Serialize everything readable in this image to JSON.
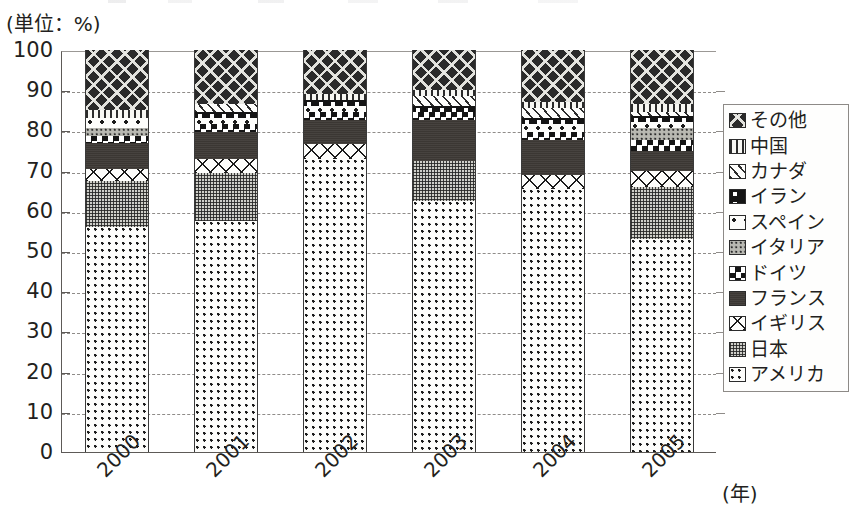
{
  "unit_label": "(単位：%)",
  "axis": {
    "y_ticks": [
      "100",
      "90",
      "80",
      "70",
      "60",
      "50",
      "40",
      "30",
      "20",
      "10",
      "0"
    ],
    "x_unit": "(年)"
  },
  "legend": {
    "items": [
      {
        "label": "その他",
        "pattern": "p-other"
      },
      {
        "label": "中国",
        "pattern": "p-china"
      },
      {
        "label": "カナダ",
        "pattern": "p-canada"
      },
      {
        "label": "イラン",
        "pattern": "p-iran"
      },
      {
        "label": "スペイン",
        "pattern": "p-spain"
      },
      {
        "label": "イタリア",
        "pattern": "p-italy"
      },
      {
        "label": "ドイツ",
        "pattern": "p-germany"
      },
      {
        "label": "フランス",
        "pattern": "p-france"
      },
      {
        "label": "イギリス",
        "pattern": "p-uk"
      },
      {
        "label": "日本",
        "pattern": "p-japan"
      },
      {
        "label": "アメリカ",
        "pattern": "p-usa"
      }
    ]
  },
  "chart_data": {
    "type": "bar",
    "stacked": true,
    "title": "",
    "xlabel": "(年)",
    "ylabel": "(単位：%)",
    "ylim": [
      0,
      100
    ],
    "ytick_step": 10,
    "grid": true,
    "legend_position": "right",
    "categories": [
      "2000",
      "2001",
      "2002",
      "2003",
      "2004",
      "2005"
    ],
    "series": [
      {
        "name": "アメリカ",
        "pattern": "p-usa",
        "values": [
          56.0,
          57.5,
          73.0,
          62.5,
          65.5,
          53.0
        ]
      },
      {
        "name": "日本",
        "pattern": "p-japan",
        "values": [
          11.5,
          12.0,
          0.0,
          10.0,
          0.0,
          13.0
        ]
      },
      {
        "name": "イギリス",
        "pattern": "p-uk",
        "values": [
          3.0,
          3.5,
          3.5,
          0.0,
          3.5,
          4.0
        ]
      },
      {
        "name": "フランス",
        "pattern": "p-france",
        "values": [
          6.5,
          6.5,
          6.0,
          10.0,
          8.5,
          5.0
        ]
      },
      {
        "name": "ドイツ",
        "pattern": "p-germany",
        "values": [
          1.5,
          2.0,
          2.0,
          2.0,
          2.0,
          2.5
        ]
      },
      {
        "name": "イタリア",
        "pattern": "p-italy",
        "values": [
          2.0,
          0.0,
          0.0,
          0.0,
          0.0,
          3.0
        ]
      },
      {
        "name": "スペイン",
        "pattern": "p-spain",
        "values": [
          2.5,
          1.5,
          1.5,
          0.0,
          2.0,
          1.5
        ]
      },
      {
        "name": "イラン",
        "pattern": "p-iran",
        "values": [
          0.0,
          1.5,
          1.5,
          1.5,
          1.5,
          1.5
        ]
      },
      {
        "name": "カナダ",
        "pattern": "p-canada",
        "values": [
          0.0,
          2.0,
          0.0,
          2.5,
          2.5,
          1.0
        ]
      },
      {
        "name": "中国",
        "pattern": "p-china",
        "values": [
          2.0,
          0.0,
          1.5,
          1.5,
          1.5,
          2.0
        ]
      },
      {
        "name": "その他",
        "pattern": "p-other",
        "values": [
          15.0,
          13.5,
          11.0,
          10.0,
          13.0,
          13.5
        ]
      }
    ]
  }
}
